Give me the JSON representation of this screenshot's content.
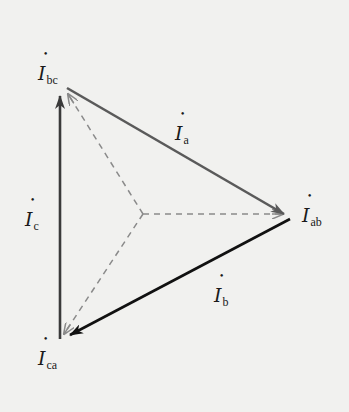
{
  "diagram": {
    "type": "phasor-diagram",
    "colors": {
      "background": "#f1f1ef",
      "phasor_a": "#5a5a5a",
      "phasor_b": "#111111",
      "phasor_c": "#3a3a3a",
      "dashed": "#8a8a8a",
      "text": "#1a1a1a"
    },
    "points": {
      "bc": [
        66,
        88
      ],
      "ab": [
        290,
        218
      ],
      "ca": [
        61,
        339
      ],
      "origin": [
        143,
        214
      ]
    },
    "labels": {
      "I_bc": {
        "symbol": "I",
        "sub": "bc"
      },
      "I_a": {
        "symbol": "I",
        "sub": "a"
      },
      "I_ab": {
        "symbol": "I",
        "sub": "ab"
      },
      "I_c": {
        "symbol": "I",
        "sub": "c"
      },
      "I_b": {
        "symbol": "I",
        "sub": "b"
      },
      "I_ca": {
        "symbol": "I",
        "sub": "ca"
      }
    },
    "edges": [
      {
        "name": "phasor-Ia",
        "from": "bc",
        "to": "ab",
        "style": "solid",
        "label": "I_a"
      },
      {
        "name": "phasor-Ib",
        "from": "ab",
        "to": "ca",
        "style": "solid",
        "label": "I_b"
      },
      {
        "name": "phasor-Ic",
        "from": "ca",
        "to": "bc",
        "style": "solid",
        "label": "I_c"
      },
      {
        "name": "phasor-Iab",
        "from": "origin",
        "to": "ab",
        "style": "dashed",
        "label": "I_ab"
      },
      {
        "name": "phasor-Ibc",
        "from": "origin",
        "to": "bc",
        "style": "dashed",
        "label": "I_bc"
      },
      {
        "name": "phasor-Ica",
        "from": "origin",
        "to": "ca",
        "style": "dashed",
        "label": "I_ca"
      }
    ]
  }
}
